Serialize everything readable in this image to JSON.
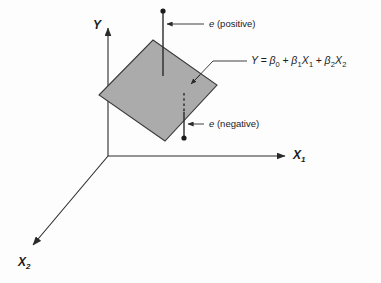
{
  "figure": {
    "caption_present": false,
    "background_color": "#fdfdfd",
    "plane_fill_color": "#ababab",
    "plane_stroke_color": "#333333",
    "line_color": "#2a2a2a"
  },
  "axes": {
    "y": {
      "label": "Y",
      "subscript": ""
    },
    "x1": {
      "label": "X",
      "subscript": "1"
    },
    "x2": {
      "label": "X",
      "subscript": "2"
    }
  },
  "annotations": {
    "error_positive": {
      "symbol": "e",
      "text": " (positive)"
    },
    "error_negative": {
      "symbol": "e",
      "text": " (negative)"
    },
    "plane_equation": {
      "lhs": "Y",
      "equals": "=",
      "term0_beta": "β",
      "term0_sub": "0",
      "plus1": "+",
      "term1_beta": "β",
      "term1_sub": "1",
      "term1_var": "X",
      "term1_var_sub": "1",
      "plus2": "+",
      "term2_beta": "β",
      "term2_sub": "2",
      "term2_var": "X",
      "term2_var_sub": "2",
      "full_text": "Y = β0 + β1X1 + β2X2"
    }
  }
}
